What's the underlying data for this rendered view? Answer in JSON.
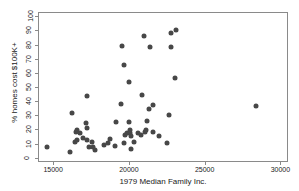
{
  "chart_data": {
    "type": "scatter",
    "title": "",
    "xlabel": "1979 Median Family Inc.",
    "ylabel": "% homes cost $100K+",
    "xlim": [
      14000,
      30500
    ],
    "ylim": [
      -3,
      103
    ],
    "xticks": [
      15000,
      20000,
      25000,
      30000
    ],
    "xtick_labels": [
      "15000",
      "20000",
      "25000",
      "30000"
    ],
    "yticks": [
      0,
      10,
      20,
      30,
      40,
      50,
      60,
      70,
      80,
      90,
      100
    ],
    "ytick_labels": [
      "0",
      "10",
      "20",
      "30",
      "40",
      "50",
      "60",
      "70",
      "80",
      "90",
      "100"
    ],
    "grid": false,
    "legend": null,
    "marker_color": "#474747",
    "marker_size": 5,
    "frame_color": "#8a8a8a",
    "points": [
      {
        "x": 14560,
        "y": 8
      },
      {
        "x": 16020,
        "y": 5
      },
      {
        "x": 16160,
        "y": 32
      },
      {
        "x": 16380,
        "y": 12
      },
      {
        "x": 16450,
        "y": 19
      },
      {
        "x": 16500,
        "y": 20
      },
      {
        "x": 16520,
        "y": 13
      },
      {
        "x": 16700,
        "y": 18
      },
      {
        "x": 16880,
        "y": 15
      },
      {
        "x": 17080,
        "y": 25
      },
      {
        "x": 17150,
        "y": 44
      },
      {
        "x": 17180,
        "y": 22
      },
      {
        "x": 17200,
        "y": 13
      },
      {
        "x": 17320,
        "y": 8
      },
      {
        "x": 17480,
        "y": 12
      },
      {
        "x": 17560,
        "y": 8
      },
      {
        "x": 17720,
        "y": 6
      },
      {
        "x": 18280,
        "y": 10
      },
      {
        "x": 18560,
        "y": 11
      },
      {
        "x": 18700,
        "y": 14
      },
      {
        "x": 19000,
        "y": 9
      },
      {
        "x": 19080,
        "y": 26
      },
      {
        "x": 19420,
        "y": 39
      },
      {
        "x": 19500,
        "y": 80
      },
      {
        "x": 19600,
        "y": 11
      },
      {
        "x": 19620,
        "y": 66
      },
      {
        "x": 19700,
        "y": 17
      },
      {
        "x": 19800,
        "y": 18
      },
      {
        "x": 19920,
        "y": 54
      },
      {
        "x": 19950,
        "y": 26
      },
      {
        "x": 20000,
        "y": 18
      },
      {
        "x": 20020,
        "y": 20
      },
      {
        "x": 20050,
        "y": 16
      },
      {
        "x": 20100,
        "y": 7
      },
      {
        "x": 20300,
        "y": 12
      },
      {
        "x": 20550,
        "y": 18
      },
      {
        "x": 20700,
        "y": 17
      },
      {
        "x": 20800,
        "y": 45
      },
      {
        "x": 20900,
        "y": 87
      },
      {
        "x": 21000,
        "y": 19
      },
      {
        "x": 21050,
        "y": 20
      },
      {
        "x": 21150,
        "y": 27
      },
      {
        "x": 21250,
        "y": 35
      },
      {
        "x": 21300,
        "y": 79
      },
      {
        "x": 21500,
        "y": 38
      },
      {
        "x": 21520,
        "y": 19
      },
      {
        "x": 21900,
        "y": 16
      },
      {
        "x": 22450,
        "y": 11
      },
      {
        "x": 22550,
        "y": 31
      },
      {
        "x": 22700,
        "y": 79
      },
      {
        "x": 22720,
        "y": 89
      },
      {
        "x": 22950,
        "y": 57
      },
      {
        "x": 23050,
        "y": 91
      },
      {
        "x": 28350,
        "y": 37
      }
    ]
  }
}
